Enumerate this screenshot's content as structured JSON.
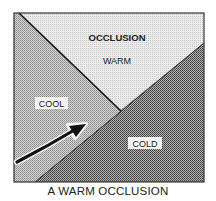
{
  "diagram": {
    "title": "A WARM OCCLUSION",
    "regions": {
      "warm": {
        "header": "OCCLUSION",
        "label": "WARM",
        "color": "#e2e2e2"
      },
      "cool": {
        "label": "COOL",
        "color": "#b6b6b6"
      },
      "cold": {
        "label": "COLD",
        "color": "#777777"
      }
    },
    "arrow": {
      "icon": "curved-arrow-icon",
      "color": "#111111"
    },
    "frame_color": "#333333"
  }
}
